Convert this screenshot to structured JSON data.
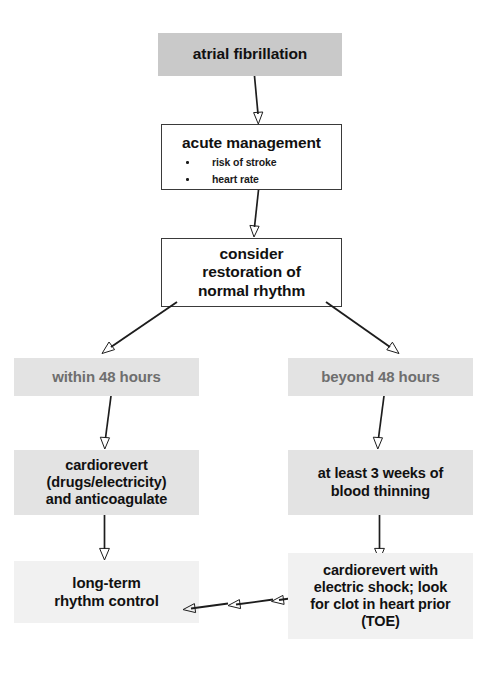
{
  "diagram": {
    "colors": {
      "box_dark": "#c9c9c9",
      "box_mid": "#e3e3e3",
      "box_light": "#f1f1f1",
      "box_outline": "#3a3a3a",
      "text_black": "#111111",
      "text_gray": "#6e6e6e",
      "arrow": "#1d1d1d",
      "background": "#ffffff"
    },
    "nodes": {
      "atrial_fibrillation": {
        "label": "atrial fibrillation"
      },
      "acute_management": {
        "heading": "acute management",
        "bullets": [
          "risk of stroke",
          "heart rate"
        ]
      },
      "consider_restoration": {
        "line1": "consider",
        "line2": "restoration of",
        "line3": "normal rhythm"
      },
      "within_48": {
        "label": "within 48 hours"
      },
      "beyond_48": {
        "label": "beyond 48 hours"
      },
      "cardiorevert_drugs": {
        "line1": "cardiorevert",
        "line2": "(drugs/electricity)",
        "line3": "and anticoagulate"
      },
      "blood_thinning": {
        "line1": "at least 3 weeks of",
        "line2": "blood thinning"
      },
      "long_term_control": {
        "line1": "long-term",
        "line2": "rhythm control"
      },
      "cardiorevert_shock": {
        "line1": "cardiorevert with",
        "line2": "electric shock; look",
        "line3": "for clot in heart prior",
        "line4": "(TOE)"
      }
    },
    "connectors": [
      {
        "name": "af-to-acute",
        "kind": "arrow-down"
      },
      {
        "name": "acute-to-consider",
        "kind": "arrow-down"
      },
      {
        "name": "consider-to-within48",
        "kind": "arrow-diagonal-left"
      },
      {
        "name": "consider-to-beyond48",
        "kind": "arrow-diagonal-right"
      },
      {
        "name": "within48-to-cardiorevert",
        "kind": "arrow-down"
      },
      {
        "name": "beyond48-to-thinning",
        "kind": "arrow-down"
      },
      {
        "name": "cardiorevert-to-longterm",
        "kind": "arrow-down"
      },
      {
        "name": "thinning-to-shock",
        "kind": "arrow-down"
      },
      {
        "name": "shock-to-longterm",
        "kind": "arrow-left-dashed-triple"
      }
    ]
  }
}
